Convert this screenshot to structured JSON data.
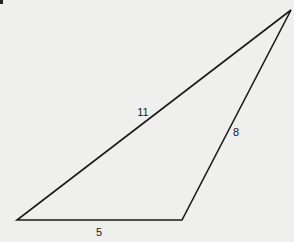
{
  "diagram": {
    "type": "triangle",
    "stroke_color": "#1a1a1a",
    "background_color": "#efefed",
    "vertices": {
      "bottom_left": {
        "x": 17,
        "y": 220
      },
      "bottom_right": {
        "x": 182,
        "y": 220
      },
      "top_right": {
        "x": 291,
        "y": 10
      }
    },
    "sides": [
      {
        "id": "hypotenuse",
        "from": "bottom_left",
        "to": "top_right",
        "label": "11"
      },
      {
        "id": "right-side",
        "from": "bottom_right",
        "to": "top_right",
        "label": "8"
      },
      {
        "id": "base",
        "from": "bottom_left",
        "to": "bottom_right",
        "label": "5"
      }
    ]
  }
}
